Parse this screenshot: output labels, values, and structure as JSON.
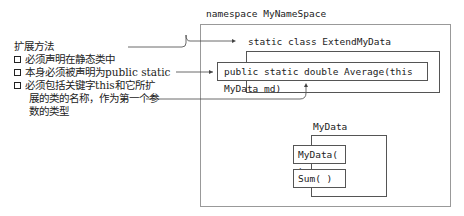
{
  "namespace": {
    "label": "namespace MyNameSpace"
  },
  "extend_class": {
    "label": "static class ExtendMyData"
  },
  "method": {
    "label": "public static double Average(this MyData md)"
  },
  "mydata_class": {
    "label": "MyData",
    "members": [
      {
        "label": "MyData( )"
      },
      {
        "label": "Sum( )"
      }
    ]
  },
  "notes": {
    "title": "扩展方法",
    "items": [
      {
        "lines": [
          "必须声明在静态类中"
        ]
      },
      {
        "lines": [
          "本身必须被声明为public static"
        ]
      },
      {
        "lines": [
          "必须包括关键字this和它所扩",
          "展的类的名称，作为第一个参",
          "数的类型"
        ]
      }
    ]
  }
}
